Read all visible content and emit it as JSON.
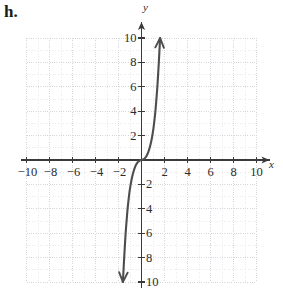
{
  "figure": {
    "item_label": "h.",
    "x_axis_name": "x",
    "y_axis_name": "y"
  },
  "colors": {
    "curve": "#4d4d4d",
    "axis": "#3a3a3a",
    "grid_minor": "#e2e2e6",
    "grid_major": "#d2d2d8",
    "text": "#2b2b2b"
  },
  "chart_data": {
    "type": "line",
    "title": "",
    "xlabel": "x",
    "ylabel": "y",
    "xlim": [
      -10,
      10
    ],
    "ylim": [
      -10,
      10
    ],
    "grid": true,
    "grid_major_step": 2,
    "grid_minor_step": 1,
    "legend": "none",
    "x_ticks": [
      -10,
      -8,
      -6,
      -4,
      -2,
      2,
      4,
      6,
      8,
      10
    ],
    "x_tick_labels": [
      "−10",
      "−8",
      "−6",
      "−4",
      "−2",
      "2",
      "4",
      "6",
      "8",
      "10"
    ],
    "y_ticks": [
      10,
      8,
      6,
      4,
      2,
      -2,
      -4,
      -6,
      -8,
      -10
    ],
    "y_tick_labels": [
      "10",
      "8",
      "6",
      "4",
      "2",
      "2",
      "4",
      "6",
      "8",
      "10"
    ],
    "series": [
      {
        "name": "cubic",
        "style": "solid",
        "arrow_start": true,
        "arrow_end": true,
        "points": [
          [
            -1.62,
            -10.0
          ],
          [
            -1.58,
            -9.3
          ],
          [
            -1.54,
            -8.6
          ],
          [
            -1.5,
            -7.9
          ],
          [
            -1.45,
            -7.1
          ],
          [
            -1.4,
            -6.3
          ],
          [
            -1.34,
            -5.5
          ],
          [
            -1.28,
            -4.8
          ],
          [
            -1.21,
            -4.0
          ],
          [
            -1.13,
            -3.3
          ],
          [
            -1.04,
            -2.6
          ],
          [
            -0.94,
            -2.0
          ],
          [
            -0.83,
            -1.45
          ],
          [
            -0.71,
            -1.0
          ],
          [
            -0.58,
            -0.62
          ],
          [
            -0.45,
            -0.35
          ],
          [
            -0.32,
            -0.17
          ],
          [
            -0.18,
            -0.06
          ],
          [
            0.0,
            0.0
          ],
          [
            0.18,
            0.06
          ],
          [
            0.32,
            0.17
          ],
          [
            0.45,
            0.35
          ],
          [
            0.58,
            0.62
          ],
          [
            0.71,
            1.0
          ],
          [
            0.83,
            1.45
          ],
          [
            0.94,
            2.0
          ],
          [
            1.04,
            2.6
          ],
          [
            1.13,
            3.3
          ],
          [
            1.21,
            4.0
          ],
          [
            1.28,
            4.8
          ],
          [
            1.34,
            5.5
          ],
          [
            1.4,
            6.3
          ],
          [
            1.45,
            7.1
          ],
          [
            1.5,
            7.9
          ],
          [
            1.54,
            8.6
          ],
          [
            1.58,
            9.3
          ],
          [
            1.62,
            10.0
          ]
        ]
      }
    ]
  }
}
